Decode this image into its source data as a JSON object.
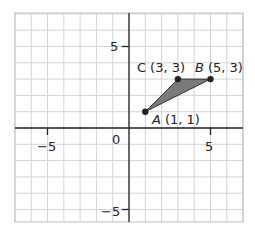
{
  "diagram": {
    "type": "coordinate-plane",
    "x_range": [
      -7,
      7
    ],
    "y_range": [
      -6,
      7
    ],
    "grid_step": 1,
    "axis_tick_labels": {
      "x": [
        {
          "value": -5,
          "label": "−5"
        },
        {
          "value": 5,
          "label": "5"
        }
      ],
      "y": [
        {
          "value": 5,
          "label": "5"
        },
        {
          "value": -5,
          "label": "−5"
        }
      ],
      "origin": "0"
    },
    "triangle": {
      "fill_color": "#7a7a7a",
      "points": [
        {
          "name": "A",
          "coords": "(1, 1)",
          "x": 1,
          "y": 1
        },
        {
          "name": "B",
          "coords": "(5, 3)",
          "x": 5,
          "y": 3
        },
        {
          "name": "C",
          "coords": "(3, 3)",
          "x": 3,
          "y": 3
        }
      ]
    },
    "colors": {
      "grid": "#d4d4d4",
      "axis": "#222222",
      "point": "#222222"
    }
  }
}
